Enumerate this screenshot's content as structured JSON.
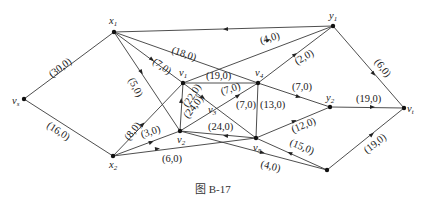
{
  "caption": "图   B-17",
  "nodes": [
    {
      "id": "vs",
      "label": "v",
      "sub": "s",
      "x": 24,
      "y": 99
    },
    {
      "id": "x1",
      "label": "x",
      "sub": "1",
      "x": 114,
      "y": 32
    },
    {
      "id": "x2",
      "label": "x",
      "sub": "2",
      "x": 113,
      "y": 156
    },
    {
      "id": "v1",
      "label": "v",
      "sub": "1",
      "x": 183,
      "y": 83
    },
    {
      "id": "v2",
      "label": "v",
      "sub": "2",
      "x": 180,
      "y": 131
    },
    {
      "id": "v3",
      "label": "v",
      "sub": "3",
      "x": 212,
      "y": 108
    },
    {
      "id": "v4",
      "label": "v",
      "sub": "4",
      "x": 258,
      "y": 83
    },
    {
      "id": "v5",
      "label": "v",
      "sub": "5",
      "x": 256,
      "y": 138
    },
    {
      "id": "y1",
      "label": "y",
      "sub": "1",
      "x": 333,
      "y": 26
    },
    {
      "id": "y2",
      "label": "y",
      "sub": "2",
      "x": 330,
      "y": 107
    },
    {
      "id": "vt",
      "label": "v",
      "sub": "t",
      "x": 404,
      "y": 108
    },
    {
      "id": "w",
      "label": "",
      "sub": "",
      "x": 327,
      "y": 170
    }
  ],
  "edges": [
    {
      "from": "vs",
      "to": "x1",
      "label": "(30,0)"
    },
    {
      "from": "vs",
      "to": "x2",
      "label": "(16,0)"
    },
    {
      "from": "x1",
      "to": "v2",
      "label": "(5,0)"
    },
    {
      "from": "x1",
      "to": "v1",
      "label": "(7,0)"
    },
    {
      "from": "y1",
      "to": "x1",
      "label": "(18,0)"
    },
    {
      "from": "x2",
      "to": "v1",
      "label": "(8,0)"
    },
    {
      "from": "x2",
      "to": "v2",
      "label": "(3,0)"
    },
    {
      "from": "x2",
      "to": "v5",
      "label": "(6,0)"
    },
    {
      "from": "v1",
      "to": "v4",
      "label": "(19,0)"
    },
    {
      "from": "v2",
      "to": "v1",
      "label": "(22,0)"
    },
    {
      "from": "v1",
      "to": "v5",
      "label": "(24,0)"
    },
    {
      "from": "v2",
      "to": "v4",
      "label": "(7,0)"
    },
    {
      "from": "v5",
      "to": "v2",
      "label": "(24,0)"
    },
    {
      "from": "v5",
      "to": "v4",
      "label": "(7,0)"
    },
    {
      "from": "v4",
      "to": "v5",
      "label": "(13,0)"
    },
    {
      "from": "v1",
      "to": "y1",
      "label": "(4,0)"
    },
    {
      "from": "v4",
      "to": "y1",
      "label": "(2,0)"
    },
    {
      "from": "v4",
      "to": "y2",
      "label": "(7,0)"
    },
    {
      "from": "y1",
      "to": "vt",
      "label": "(6,0)"
    },
    {
      "from": "y2",
      "to": "vt",
      "label": "(19,0)"
    },
    {
      "from": "v5",
      "to": "y2",
      "label": "(12,0)"
    },
    {
      "from": "w",
      "to": "v5",
      "label": "(15,0)"
    },
    {
      "from": "v2",
      "to": "w",
      "label": "(4,0)"
    },
    {
      "from": "w",
      "to": "vt",
      "label": "(19,0)"
    }
  ],
  "labels": {
    "e_vs_x1": "(30,0)",
    "e_vs_x2": "(16,0)",
    "e_x1_v2": "(5,0)",
    "e_x1_v1": "(7,0)",
    "e_y1_x1": "(18,0)",
    "e_x2_v1": "(8,0)",
    "e_x2_v2": "(3,0)",
    "e_x2_v5": "(6,0)",
    "e_v1_v4": "(19,0)",
    "e_v2_v1": "(22,0)",
    "e_v1_v5": "(24,0)",
    "e_v2_v4": "(7,0)",
    "e_v5_v2": "(24,0)",
    "e_v5_v4": "(7,0)",
    "e_v4_v5": "(13,0)",
    "e_v1_y1": "(4,0)",
    "e_v4_y1": "(2,0)",
    "e_v4_y2": "(7,0)",
    "e_y1_vt": "(6,0)",
    "e_y2_vt": "(19,0)",
    "e_v5_y2": "(12,0)",
    "e_w_v5": "(15,0)",
    "e_v2_w": "(4,0)",
    "e_w_vt": "(19,0)"
  },
  "node_labels": {
    "vs": "v",
    "vs_sub": "s",
    "x1": "x",
    "x1_sub": "1",
    "x2": "x",
    "x2_sub": "2",
    "v1": "v",
    "v1_sub": "1",
    "v2": "v",
    "v2_sub": "2",
    "v3": "v",
    "v3_sub": "3",
    "v4": "v",
    "v4_sub": "4",
    "v5": "v",
    "v5_sub": "5",
    "y1": "y",
    "y1_sub": "1",
    "y2": "y",
    "y2_sub": "2",
    "vt": "v",
    "vt_sub": "t"
  }
}
